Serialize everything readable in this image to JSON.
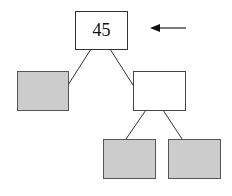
{
  "diagram": {
    "type": "binary-tree",
    "colors": {
      "stroke": "#333333",
      "filled": "#cccccc",
      "empty": "#ffffff",
      "arrow": "#111111"
    },
    "nodes": [
      {
        "id": "root",
        "label": "45",
        "fill": "empty"
      },
      {
        "id": "left",
        "label": "",
        "fill": "filled"
      },
      {
        "id": "right",
        "label": "",
        "fill": "empty"
      },
      {
        "id": "right-left",
        "label": "",
        "fill": "filled"
      },
      {
        "id": "right-right",
        "label": "",
        "fill": "filled"
      }
    ],
    "edges": [
      {
        "from": "root",
        "to": "left"
      },
      {
        "from": "root",
        "to": "right"
      },
      {
        "from": "right",
        "to": "right-left"
      },
      {
        "from": "right",
        "to": "right-right"
      }
    ],
    "pointer": {
      "target": "root",
      "direction": "left"
    }
  }
}
